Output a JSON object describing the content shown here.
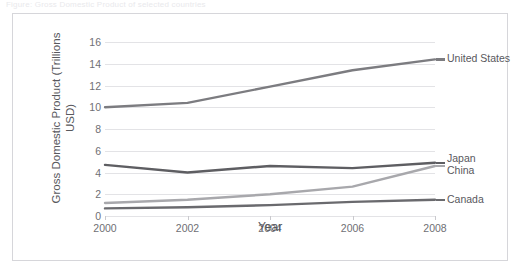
{
  "top_caption": "Figure: Gross Domestic Product of selected countries",
  "chart_data": {
    "type": "line",
    "title": "",
    "xlabel": "Year",
    "ylabel": "Gross Domestic Product (Trillions USD)",
    "x": [
      2000,
      2002,
      2004,
      2006,
      2008
    ],
    "xticklabels": [
      "2000",
      "2002",
      "2004",
      "2006",
      "2008"
    ],
    "yticklabels": [
      "0",
      "2",
      "4",
      "6",
      "8",
      "10",
      "12",
      "14",
      "16"
    ],
    "yticks": [
      0,
      2,
      4,
      6,
      8,
      10,
      12,
      14,
      16
    ],
    "ylim": [
      0,
      16
    ],
    "xlim": [
      2000,
      2008
    ],
    "grid": "horizontal",
    "legend_position": "right-of-plot",
    "series": [
      {
        "name": "United States",
        "values": [
          10.0,
          10.4,
          11.9,
          13.4,
          14.4
        ],
        "color": "#7c7c80"
      },
      {
        "name": "Japan",
        "values": [
          4.7,
          4.0,
          4.6,
          4.4,
          4.9
        ],
        "color": "#5e5e62"
      },
      {
        "name": "China",
        "values": [
          1.2,
          1.5,
          2.0,
          2.7,
          4.6
        ],
        "color": "#a8a8ac"
      },
      {
        "name": "Canada",
        "values": [
          0.7,
          0.8,
          1.0,
          1.3,
          1.5
        ],
        "color": "#6a6a6e"
      }
    ]
  },
  "colors": {
    "frame": "#d6d6da",
    "grid": "#e3e3e6",
    "axis_text": "#6f6f74",
    "label_text": "#58585d",
    "background": "#ffffff"
  }
}
